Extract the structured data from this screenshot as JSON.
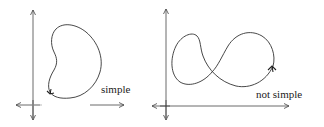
{
  "diagram": {
    "panels": [
      {
        "id": "left",
        "label": "simple",
        "curve": "simple closed curve (bean shape)"
      },
      {
        "id": "right",
        "label": "not simple",
        "curve": "self-intersecting closed curve (figure-eight)"
      }
    ],
    "colors": {
      "stroke": "#333333",
      "axis": "#444444",
      "background": "#ffffff"
    }
  }
}
